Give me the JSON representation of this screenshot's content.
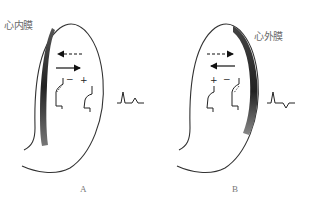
{
  "diagram": {
    "panels": [
      {
        "id": "A",
        "letter": "A",
        "layer_label": "心内膜",
        "highlighted_layer": "endocardium",
        "arrows": [
          {
            "direction": "left",
            "style": "dashed"
          },
          {
            "direction": "right",
            "style": "solid"
          }
        ],
        "action_potentials": [
          {
            "sign": "−",
            "position": "inner"
          },
          {
            "sign": "+",
            "position": "outer"
          }
        ],
        "ecg_waveform": "upright-R-upright-T"
      },
      {
        "id": "B",
        "letter": "B",
        "layer_label": "心外膜",
        "highlighted_layer": "epicardium",
        "arrows": [
          {
            "direction": "right",
            "style": "dashed"
          },
          {
            "direction": "left",
            "style": "solid"
          }
        ],
        "action_potentials": [
          {
            "sign": "+",
            "position": "inner"
          },
          {
            "sign": "−",
            "position": "outer"
          }
        ],
        "ecg_waveform": "upright-R-inverted-T"
      }
    ],
    "colors": {
      "outline": "#333333",
      "shading": "#2b2b2b",
      "text": "#6a6a6a"
    }
  }
}
